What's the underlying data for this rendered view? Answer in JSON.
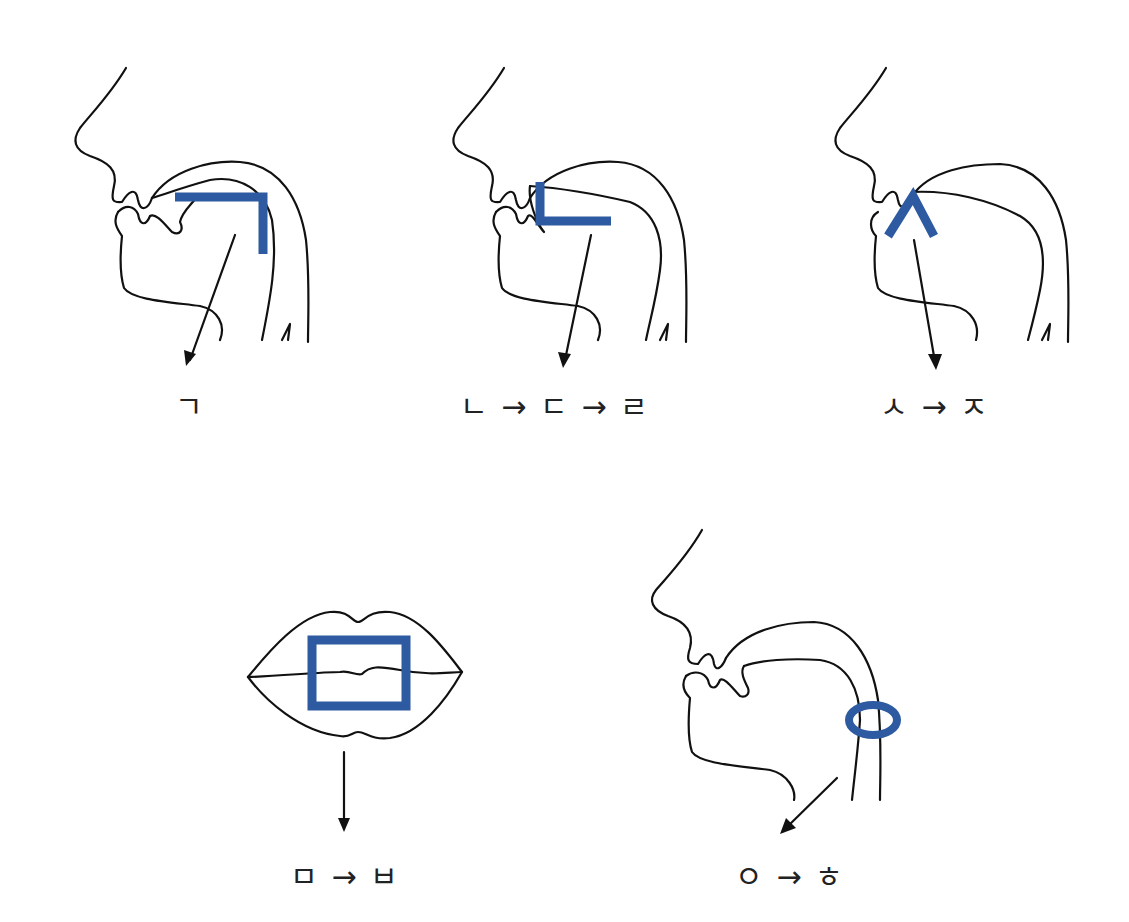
{
  "diagram": {
    "title": "",
    "accent_color": "#2d5aa0",
    "line_color": "#111111",
    "panels": [
      {
        "id": "velar",
        "organ": "tongue root blocking throat",
        "marker_shape": "inverted-L",
        "label": "ㄱ"
      },
      {
        "id": "alveolar",
        "organ": "tongue tip touching upper gum",
        "marker_shape": "L",
        "label": "ㄴ → ㄷ → ㄹ"
      },
      {
        "id": "dental",
        "organ": "teeth",
        "marker_shape": "caret",
        "label": "ㅅ → ㅈ"
      },
      {
        "id": "labial",
        "organ": "mouth / lips",
        "marker_shape": "square",
        "label": "ㅁ → ㅂ"
      },
      {
        "id": "glottal",
        "organ": "throat",
        "marker_shape": "circle",
        "label": "ㅇ → ㅎ"
      }
    ]
  }
}
